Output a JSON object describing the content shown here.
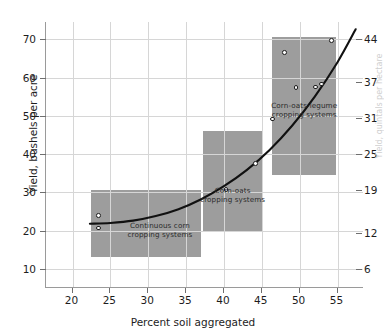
{
  "chart_data": {
    "type": "scatter",
    "title": "",
    "xlabel": "Percent soil aggregated",
    "ylabel": "Yield, bushels per acre",
    "ylabel_right": "Yield, quintals per hectare",
    "xlim": [
      16.5,
      58.5
    ],
    "ylim": [
      5.0,
      74.5
    ],
    "xticks": [
      20,
      25,
      30,
      35,
      40,
      45,
      50,
      55
    ],
    "yticks": [
      10,
      20,
      30,
      40,
      50,
      60,
      70
    ],
    "yticks_right": [
      6,
      12,
      19,
      25,
      31,
      37,
      44
    ],
    "grid": true,
    "legend": "none",
    "points": [
      {
        "x": 23.4,
        "y": 24.0
      },
      {
        "x": 23.4,
        "y": 20.7
      },
      {
        "x": 40.3,
        "y": 30.8
      },
      {
        "x": 44.2,
        "y": 37.5
      },
      {
        "x": 46.4,
        "y": 49.2
      },
      {
        "x": 48.0,
        "y": 66.5
      },
      {
        "x": 49.5,
        "y": 57.4
      },
      {
        "x": 52.1,
        "y": 57.5
      },
      {
        "x": 52.9,
        "y": 58.3
      },
      {
        "x": 54.2,
        "y": 69.6
      }
    ],
    "curve": [
      {
        "x": 22.3,
        "y": 21.8
      },
      {
        "x": 25.0,
        "y": 22.0
      },
      {
        "x": 28.0,
        "y": 22.6
      },
      {
        "x": 31.0,
        "y": 23.8
      },
      {
        "x": 34.0,
        "y": 25.6
      },
      {
        "x": 37.0,
        "y": 28.2
      },
      {
        "x": 40.0,
        "y": 31.6
      },
      {
        "x": 43.0,
        "y": 35.8
      },
      {
        "x": 46.0,
        "y": 41.0
      },
      {
        "x": 49.0,
        "y": 47.4
      },
      {
        "x": 52.0,
        "y": 55.0
      },
      {
        "x": 55.0,
        "y": 64.0
      },
      {
        "x": 57.4,
        "y": 72.6
      }
    ],
    "bands": [
      {
        "name": "continuous-corn",
        "label_lines": [
          "Continuous corn",
          "cropping systems"
        ],
        "rects": [
          {
            "x0": 22.4,
            "x1": 37.0,
            "y0": 13.0,
            "y1": 30.5
          },
          {
            "x0": 22.4,
            "x1": 30.4,
            "y0": 13.0,
            "y1": 30.5
          }
        ]
      },
      {
        "name": "corn-oats",
        "label_lines": [
          "Corn-oats",
          "cropping systems"
        ],
        "rects": [
          {
            "x0": 37.3,
            "x1": 45.0,
            "y0": 20.0,
            "y1": 46.0
          }
        ]
      },
      {
        "name": "corn-oats-legume",
        "label_lines": [
          "Corn-oats-legume",
          "cropping systems"
        ],
        "rects": [
          {
            "x0": 46.4,
            "x1": 54.8,
            "y0": 34.5,
            "y1": 70.5
          }
        ]
      }
    ],
    "colors": {
      "band_fill": "#9d9d9d",
      "curve": "#111111",
      "grid": "#d6d6d6",
      "axis": "#9a9a9a",
      "point_fill": "#ffffff",
      "point_edge": "#1c1c1c",
      "background": "#ffffff"
    }
  }
}
